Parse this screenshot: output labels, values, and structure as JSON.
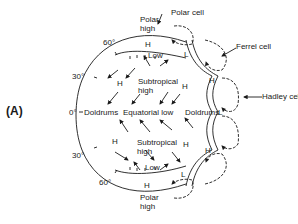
{
  "panel_label": "(A)",
  "latitudes": {
    "n60": "60°",
    "n30": "30°",
    "eq": "0°",
    "s30": "30°",
    "s60": "60°"
  },
  "cells": {
    "polar": "Polar cell",
    "ferrel": "Ferrel cell",
    "hadley": "Hadley cell"
  },
  "pressure": {
    "polar_high_n_l1": "Polar",
    "polar_high_n_l2": "high",
    "polar_high_s_l1": "Polar",
    "polar_high_s_l2": "high",
    "h": "H",
    "low": "Low",
    "l": "L",
    "subtropical_n_l1": "Subtropical",
    "subtropical_n_l2": "high",
    "subtropical_s_l1": "Subtropical",
    "subtropical_s_l2": "high",
    "doldrums": "Doldrums",
    "equatorial_low": "Equatorial low"
  },
  "colors": {
    "ink": "#1a1a1a",
    "background": "#ffffff"
  }
}
